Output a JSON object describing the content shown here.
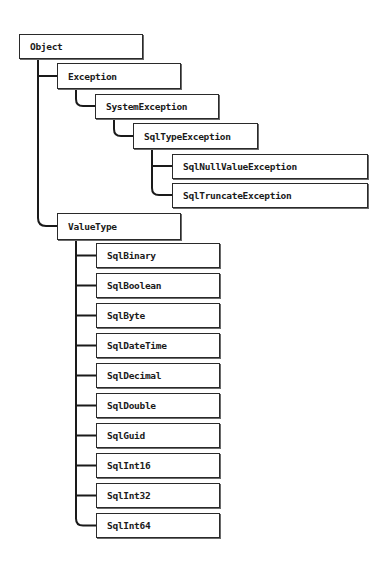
{
  "diagram": {
    "type": "class-hierarchy",
    "root": "Object",
    "nodes": {
      "object": "Object",
      "exception": "Exception",
      "system_exception": "SystemException",
      "sql_type_exception": "SqlTypeException",
      "sql_null_value_exception": "SqlNullValueException",
      "sql_truncate_exception": "SqlTruncateException",
      "value_type": "ValueType"
    },
    "value_type_children": [
      "SqlBinary",
      "SqlBoolean",
      "SqlByte",
      "SqlDateTime",
      "SqlDecimal",
      "SqlDouble",
      "SqlGuid",
      "SqlInt16",
      "SqlInt32",
      "SqlInt64"
    ],
    "edges": [
      [
        "Object",
        "Exception"
      ],
      [
        "Object",
        "ValueType"
      ],
      [
        "Exception",
        "SystemException"
      ],
      [
        "SystemException",
        "SqlTypeException"
      ],
      [
        "SqlTypeException",
        "SqlNullValueException"
      ],
      [
        "SqlTypeException",
        "SqlTruncateException"
      ],
      [
        "ValueType",
        "SqlBinary"
      ],
      [
        "ValueType",
        "SqlBoolean"
      ],
      [
        "ValueType",
        "SqlByte"
      ],
      [
        "ValueType",
        "SqlDateTime"
      ],
      [
        "ValueType",
        "SqlDecimal"
      ],
      [
        "ValueType",
        "SqlDouble"
      ],
      [
        "ValueType",
        "SqlGuid"
      ],
      [
        "ValueType",
        "SqlInt16"
      ],
      [
        "ValueType",
        "SqlInt32"
      ],
      [
        "ValueType",
        "SqlInt64"
      ]
    ]
  }
}
